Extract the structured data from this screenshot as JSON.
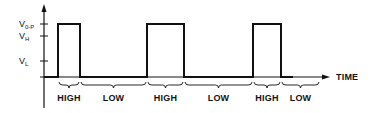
{
  "diagram": {
    "type": "pulse-waveform",
    "colors": {
      "line": "#111111",
      "background": "#ffffff"
    },
    "axis": {
      "x_label": "TIME",
      "origin": {
        "x": 44,
        "y": 77
      },
      "y_top": 4,
      "y_bottom": 108,
      "x_end": 330
    },
    "y_levels": [
      {
        "main": "V",
        "sub": "0-P",
        "y": 24
      },
      {
        "main": "V",
        "sub": "H",
        "y": 36
      },
      {
        "main": "V",
        "sub": "L",
        "y": 61
      }
    ],
    "pulses": [
      {
        "x_start": 58,
        "x_end": 80,
        "top": 24
      },
      {
        "x_start": 147,
        "x_end": 184,
        "top": 24
      },
      {
        "x_start": 253,
        "x_end": 281,
        "top": 24
      }
    ],
    "segments": [
      {
        "label": "HIGH",
        "x_start": 58,
        "x_end": 80
      },
      {
        "label": "LOW",
        "x_start": 80,
        "x_end": 147
      },
      {
        "label": "HIGH",
        "x_start": 147,
        "x_end": 184
      },
      {
        "label": "LOW",
        "x_start": 184,
        "x_end": 253
      },
      {
        "label": "HIGH",
        "x_start": 253,
        "x_end": 281
      },
      {
        "label": "LOW",
        "x_start": 281,
        "x_end": 320
      }
    ]
  }
}
